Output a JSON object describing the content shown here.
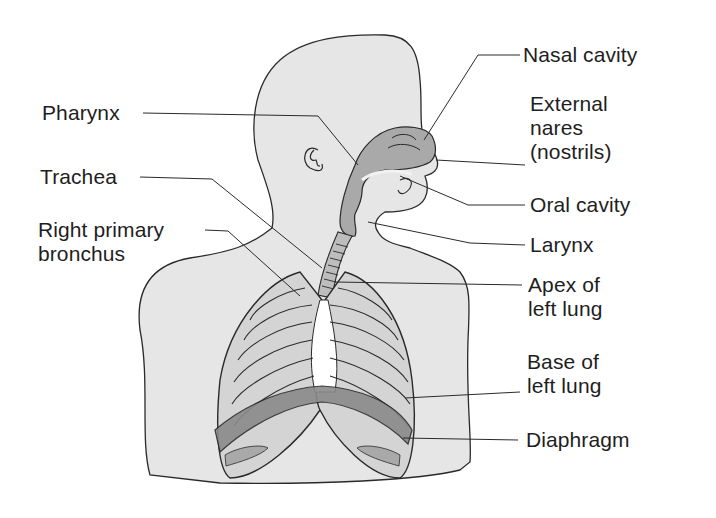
{
  "diagram": {
    "colors": {
      "body_fill": "#e6e6e6",
      "outline": "#2a2a2a",
      "airway_fill": "#a9a9a9",
      "lung_fill": "#d4d4d4",
      "rib_bone": "#f4f4f4",
      "diaphragm_fill": "#8a8a8a",
      "text": "#1e1e1e"
    },
    "labels": {
      "left": [
        {
          "id": "pharynx",
          "lines": [
            "Pharynx"
          ]
        },
        {
          "id": "trachea",
          "lines": [
            "Trachea"
          ]
        },
        {
          "id": "right_primary_bronchus",
          "lines": [
            "Right primary",
            "bronchus"
          ]
        }
      ],
      "right": [
        {
          "id": "nasal_cavity",
          "lines": [
            "Nasal cavity"
          ]
        },
        {
          "id": "external_nares",
          "lines": [
            "External",
            "nares",
            "(nostrils)"
          ]
        },
        {
          "id": "oral_cavity",
          "lines": [
            "Oral cavity"
          ]
        },
        {
          "id": "larynx",
          "lines": [
            "Larynx"
          ]
        },
        {
          "id": "apex_left_lung",
          "lines": [
            "Apex of",
            "left lung"
          ]
        },
        {
          "id": "base_left_lung",
          "lines": [
            "Base of",
            "left lung"
          ]
        },
        {
          "id": "diaphragm",
          "lines": [
            "Diaphragm"
          ]
        }
      ]
    }
  }
}
